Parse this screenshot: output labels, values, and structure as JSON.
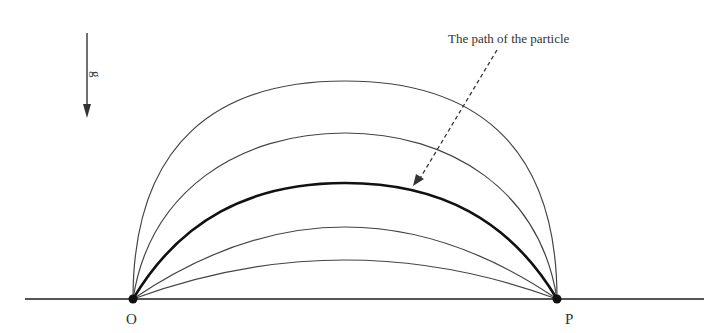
{
  "diagram": {
    "type": "projectile trajectories",
    "gravity_label": "g",
    "annotation": "The path of the particle",
    "points": [
      {
        "label": "O",
        "x": 133,
        "y": 299
      },
      {
        "label": "P",
        "x": 557,
        "y": 299
      }
    ],
    "ground": {
      "x1": 25,
      "x2": 704,
      "y": 299
    },
    "curves": [
      {
        "peak_y": 81,
        "highlighted": false
      },
      {
        "peak_y": 133,
        "highlighted": false
      },
      {
        "peak_y": 183,
        "highlighted": true
      },
      {
        "peak_y": 227,
        "highlighted": false
      },
      {
        "peak_y": 260,
        "highlighted": false
      }
    ],
    "colors": {
      "line": "#333333",
      "highlight": "#111111"
    }
  }
}
